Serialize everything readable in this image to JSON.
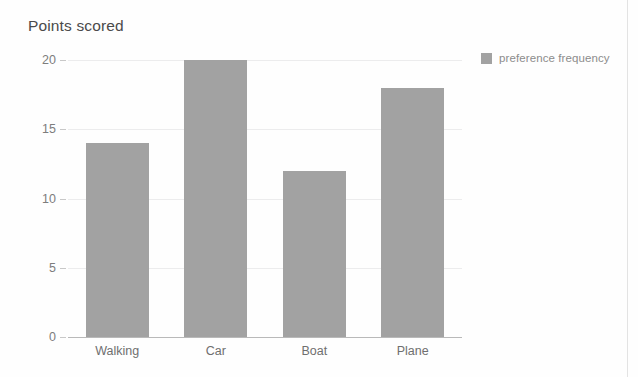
{
  "chart_data": {
    "type": "bar",
    "title": "Points scored",
    "xlabel": "",
    "ylabel": "",
    "categories": [
      "Walking",
      "Car",
      "Boat",
      "Plane"
    ],
    "values": [
      14,
      20,
      12,
      18
    ],
    "series": [
      {
        "name": "preference frequency",
        "values": [
          14,
          20,
          12,
          18
        ]
      }
    ],
    "ylim": [
      0,
      20
    ],
    "yticks": [
      0,
      5,
      10,
      15,
      20
    ],
    "ytick_labels": [
      "0",
      "5",
      "10",
      "15",
      "20"
    ],
    "grid": true,
    "legend_position": "right",
    "bar_color": "#a2a2a2",
    "gridline_color": "#ececed",
    "axis_color": "#b9b9b9",
    "title_color": "#4a4a4a",
    "tick_label_color": "#7d7d7d",
    "legend_label_color": "#8c8c8c"
  },
  "legend": {
    "entries": [
      {
        "label": "preference frequency",
        "color": "#a2a2a2"
      }
    ]
  }
}
